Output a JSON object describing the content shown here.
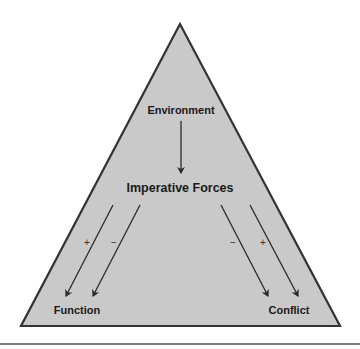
{
  "diagram": {
    "shape": "triangle",
    "fill_color": "#c8c8c8",
    "stroke_color": "#333333",
    "nodes": {
      "environment": "Environment",
      "imperative_forces": "Imperative Forces",
      "function": "Function",
      "conflict": "Conflict"
    },
    "edges": [
      {
        "from": "Environment",
        "to": "Imperative Forces",
        "sign": ""
      },
      {
        "from": "Imperative Forces",
        "to": "Function",
        "sign": "+"
      },
      {
        "from": "Imperative Forces",
        "to": "Function",
        "sign": "−"
      },
      {
        "from": "Imperative Forces",
        "to": "Conflict",
        "sign": "−"
      },
      {
        "from": "Imperative Forces",
        "to": "Conflict",
        "sign": "+"
      }
    ],
    "signs": {
      "func_plus": "+",
      "func_minus": "−",
      "conf_minus": "−",
      "conf_plus": "+"
    }
  }
}
